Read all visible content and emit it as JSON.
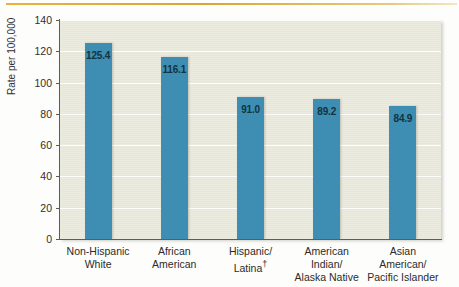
{
  "chart_data": {
    "type": "bar",
    "title": "",
    "xlabel": "",
    "ylabel": "Rate per 100,000",
    "ylim": [
      0,
      140
    ],
    "ytick_values": [
      0,
      20,
      40,
      60,
      80,
      100,
      120,
      140
    ],
    "ytick_labels": [
      "0",
      "20",
      "40",
      "60",
      "80",
      "100",
      "120",
      "140"
    ],
    "grid": true,
    "legend": "none",
    "categories": [
      "Non-Hispanic\nWhite",
      "African\nAmerican",
      "Hispanic/\nLatina†",
      "American\nIndian/\nAlaska Native",
      "Asian\nAmerican/\nPacific Islander"
    ],
    "values": [
      125.4,
      116.1,
      91.0,
      89.2,
      84.9
    ],
    "value_labels": [
      "125.4",
      "116.1",
      "91.0",
      "89.2",
      "84.9"
    ],
    "bar_color": "#3d8eb2",
    "plot_background": "#e9e9dd",
    "value_label_color": "#14323f"
  },
  "axes": {
    "y_title": "Rate per 100,000"
  }
}
